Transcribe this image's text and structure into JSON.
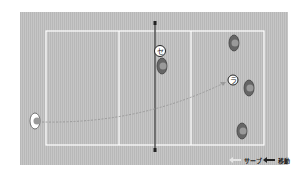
{
  "diagram": {
    "type": "volleyball-court-rotation",
    "court": {
      "bg_color": "#c0c0c0",
      "line_color": "#ffffff",
      "net_color": "#555555"
    },
    "markers": [
      {
        "id": "setter",
        "label": "セ",
        "x": 160,
        "y": 51
      },
      {
        "id": "receiver",
        "label": "ラ",
        "x": 233,
        "y": 80
      }
    ],
    "players": [
      {
        "id": "server",
        "x": 37,
        "y": 121,
        "style": "light"
      },
      {
        "id": "front-center",
        "x": 163,
        "y": 66,
        "style": "dark"
      },
      {
        "id": "back-top",
        "x": 235,
        "y": 43,
        "style": "dark"
      },
      {
        "id": "back-middle",
        "x": 250,
        "y": 88,
        "style": "dark"
      },
      {
        "id": "back-bottom",
        "x": 243,
        "y": 131,
        "style": "dark"
      }
    ],
    "serve_path": {
      "from": [
        42,
        122
      ],
      "to": [
        226,
        82
      ],
      "style": "dashed-light"
    }
  },
  "legend": {
    "serve_label": "サーブ",
    "move_label": "移動"
  }
}
